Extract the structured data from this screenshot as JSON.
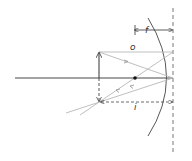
{
  "diagram": {
    "type": "concave-mirror-ray-diagram",
    "labels": {
      "focal_length": "f",
      "object_distance": "o",
      "image_distance": "i"
    },
    "colors": {
      "axis": "#333333",
      "rays": "#b8b8b8",
      "mirror": "#444444",
      "dashed": "#555555",
      "object": "#333333"
    },
    "elements": {
      "object_arrow": "upright object",
      "image_arrow": "inverted real image",
      "focal_point": "focal point F",
      "mirror": "concave mirror",
      "mirror_plane": "dashed vertical reference line"
    }
  }
}
